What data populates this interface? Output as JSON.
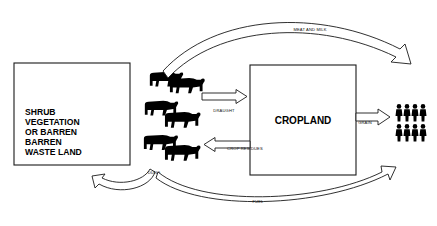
{
  "diagram": {
    "background_color": "#ffffff",
    "line_color": "#1a1a1a",
    "nodes": [
      {
        "id": "shrub",
        "name": "shrub-vegetation-box",
        "label_lines": [
          "SHRUB",
          "VEGETATION",
          "OR BARREN",
          "BARREN",
          "WASTE LAND"
        ],
        "x": 14,
        "y": 63,
        "width": 116,
        "height": 102
      },
      {
        "id": "cropland",
        "name": "cropland-box",
        "label_lines": [
          "CROPLAND"
        ],
        "x": 250,
        "y": 65,
        "width": 106,
        "height": 110
      }
    ],
    "cattle": {
      "name": "cattle-herd",
      "count": 6,
      "rows": 3
    },
    "people": {
      "name": "people-group",
      "count": 8,
      "rows": 2,
      "per_row": 4
    },
    "flows": [
      {
        "id": "meat_and_milk",
        "label": "MEAT AND MILK",
        "from": "cattle",
        "to": "people",
        "label_x": 310,
        "label_y": 31
      },
      {
        "id": "draught",
        "label": "DRAUGHT",
        "from": "cattle",
        "to": "cropland",
        "label_x": 224,
        "label_y": 112
      },
      {
        "id": "crop_residues",
        "label": "CROP RESIDUES",
        "from": "cropland",
        "to": "cattle",
        "label_x": 245,
        "label_y": 150
      },
      {
        "id": "grain",
        "label": "GRAIN",
        "from": "cropland",
        "to": "people",
        "label_x": 365,
        "label_y": 124
      },
      {
        "id": "dung",
        "label": "DUNG",
        "from": "cattle",
        "to": "shrub",
        "label_x": 154,
        "label_y": 174
      },
      {
        "id": "fuel",
        "label": "FUEL",
        "from": "cattle",
        "to": "people",
        "label_x": 258,
        "label_y": 203
      }
    ]
  }
}
